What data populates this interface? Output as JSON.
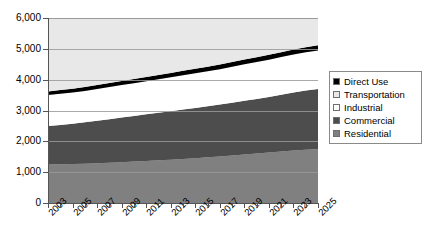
{
  "chart_data": {
    "type": "area",
    "title": "",
    "xlabel": "",
    "ylabel": "",
    "stacked": true,
    "grid": true,
    "legend_position": "right",
    "ylim": [
      0,
      6000
    ],
    "ytick_labels": [
      "6,000",
      "5,000",
      "4,000",
      "3,000",
      "2,000",
      "1,000",
      "0"
    ],
    "ytick_values": [
      6000,
      5000,
      4000,
      3000,
      2000,
      1000,
      0
    ],
    "xlim": [
      2003,
      2025
    ],
    "x": [
      2003,
      2004,
      2005,
      2006,
      2007,
      2008,
      2009,
      2010,
      2011,
      2012,
      2013,
      2014,
      2015,
      2016,
      2017,
      2018,
      2019,
      2020,
      2021,
      2022,
      2023,
      2024,
      2025
    ],
    "xtick_labels": [
      "2003",
      "2005",
      "2007",
      "2009",
      "2011",
      "2013",
      "2015",
      "2017",
      "2019",
      "2021",
      "2023",
      "2025"
    ],
    "series": [
      {
        "name": "Residential",
        "color": "#808080",
        "values": [
          1250,
          1255,
          1265,
          1275,
          1290,
          1305,
          1325,
          1345,
          1365,
          1385,
          1405,
          1430,
          1455,
          1480,
          1505,
          1540,
          1575,
          1605,
          1635,
          1670,
          1700,
          1725,
          1750
        ]
      },
      {
        "name": "Commercial",
        "color": "#4d4d4d",
        "values": [
          1250,
          1275,
          1305,
          1340,
          1380,
          1415,
          1450,
          1480,
          1510,
          1540,
          1570,
          1600,
          1630,
          1660,
          1690,
          1715,
          1740,
          1770,
          1800,
          1840,
          1880,
          1920,
          1950
        ]
      },
      {
        "name": "Industrial",
        "color": "#ffffff",
        "values": [
          1000,
          1010,
          1015,
          1020,
          1030,
          1040,
          1050,
          1060,
          1075,
          1090,
          1105,
          1115,
          1125,
          1135,
          1145,
          1165,
          1185,
          1200,
          1215,
          1225,
          1235,
          1245,
          1250
        ]
      },
      {
        "name": "Direct Use",
        "color": "#000000",
        "values": [
          120,
          122,
          124,
          126,
          128,
          130,
          132,
          134,
          136,
          138,
          140,
          142,
          144,
          146,
          148,
          150,
          152,
          154,
          156,
          158,
          160,
          162,
          165
        ]
      },
      {
        "name": "Transportation",
        "color": "#e8e8e8",
        "values": [
          2380,
          2338,
          2291,
          2239,
          2172,
          2110,
          2043,
          1981,
          1914,
          1847,
          1780,
          1713,
          1646,
          1579,
          1512,
          1430,
          1348,
          1271,
          1194,
          1107,
          1025,
          948,
          885
        ]
      }
    ],
    "cumulative_top": [
      5000,
      5000,
      5000,
      5000,
      5000,
      5000,
      5000,
      5000,
      5000,
      5000,
      5000,
      5000,
      5000,
      5000,
      5000,
      5000,
      5000,
      5000,
      5000,
      5000,
      5000,
      5000,
      5000
    ]
  },
  "legend": {
    "items": [
      {
        "label": "Direct Use",
        "color": "#000000"
      },
      {
        "label": "Transportation",
        "color": "#e8e8e8"
      },
      {
        "label": "Industrial",
        "color": "#ffffff"
      },
      {
        "label": "Commercial",
        "color": "#4d4d4d"
      },
      {
        "label": "Residential",
        "color": "#808080"
      }
    ]
  }
}
